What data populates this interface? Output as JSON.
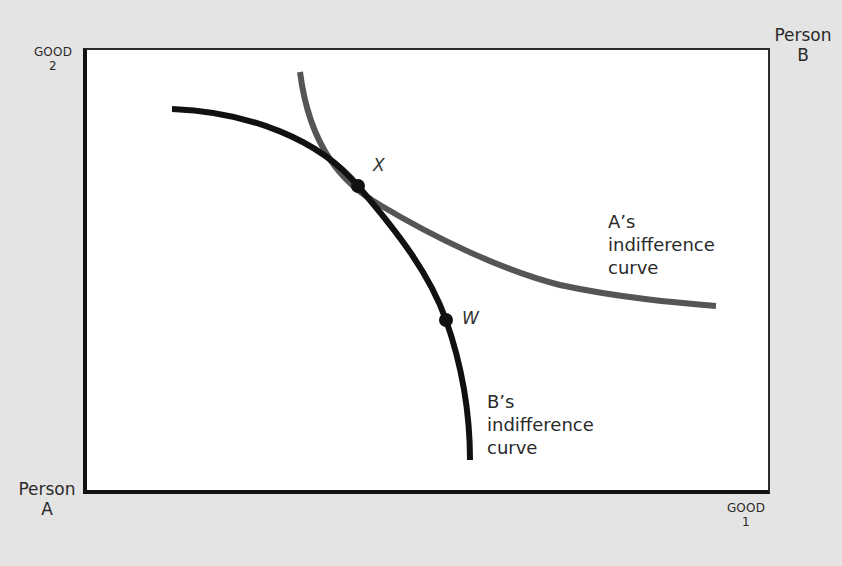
{
  "axes": {
    "origin_a": {
      "line1": "Person",
      "line2": "A"
    },
    "origin_b": {
      "line1": "Person",
      "line2": "B"
    },
    "y_axis": {
      "line1": "GOOD",
      "line2": "2"
    },
    "x_axis": {
      "line1": "GOOD",
      "line2": "1"
    }
  },
  "curves": {
    "a": {
      "line1": "A’s",
      "line2": "indifference",
      "line3": "curve",
      "color": "#555555"
    },
    "b": {
      "line1": "B’s",
      "line2": "indifference",
      "line3": "curve",
      "color": "#111111"
    }
  },
  "points": {
    "x": "X",
    "w": "W"
  },
  "colors": {
    "background": "#e4e4e4",
    "plot_area": "#ffffff",
    "b_curve": "#111111",
    "a_curve": "#555555"
  }
}
